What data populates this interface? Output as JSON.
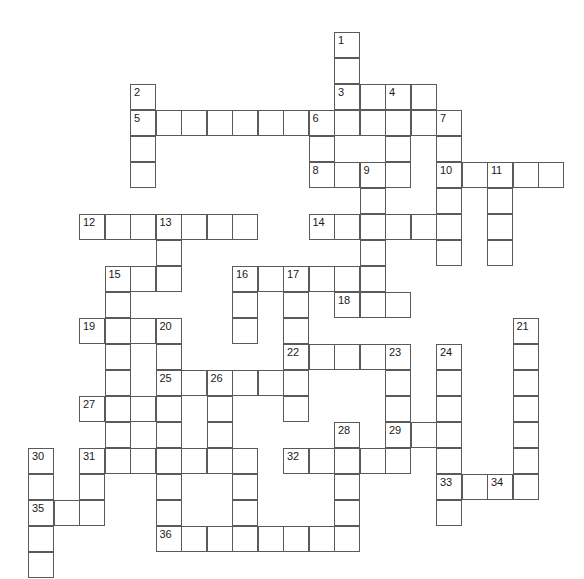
{
  "puzzle": {
    "title": "Crossword Grid",
    "type": "crossword-grid",
    "canvas": {
      "width": 584,
      "height": 579,
      "background": "#ffffff"
    },
    "geometry": {
      "cell_size": 26,
      "col_pitch": 25.5,
      "row_pitch": 26,
      "origin_x": 28,
      "origin_y": 32,
      "cell_border_color": "#5a5a5a",
      "cell_fill": "#ffffff",
      "number_color": "#1a1a1a",
      "number_font_size": 11
    },
    "counts": {
      "numbered_clues": 36,
      "total_cells": 197
    },
    "numbers": [
      1,
      2,
      3,
      4,
      5,
      6,
      7,
      8,
      9,
      10,
      11,
      12,
      13,
      14,
      15,
      16,
      17,
      18,
      19,
      20,
      21,
      22,
      23,
      24,
      25,
      26,
      27,
      28,
      29,
      30,
      31,
      32,
      33,
      34,
      35,
      36
    ],
    "cells": [
      {
        "r": 0,
        "c": 12,
        "n": "1"
      },
      {
        "r": 1,
        "c": 12
      },
      {
        "r": 2,
        "c": 12,
        "n": "3"
      },
      {
        "r": 2,
        "c": 13
      },
      {
        "r": 2,
        "c": 14,
        "n": "4"
      },
      {
        "r": 2,
        "c": 15
      },
      {
        "r": 2,
        "c": 4,
        "n": "2"
      },
      {
        "r": 3,
        "c": 4,
        "n": "5"
      },
      {
        "r": 3,
        "c": 5
      },
      {
        "r": 3,
        "c": 6
      },
      {
        "r": 3,
        "c": 7
      },
      {
        "r": 3,
        "c": 8
      },
      {
        "r": 3,
        "c": 9
      },
      {
        "r": 3,
        "c": 10
      },
      {
        "r": 3,
        "c": 11,
        "n": "6"
      },
      {
        "r": 3,
        "c": 12
      },
      {
        "r": 3,
        "c": 13
      },
      {
        "r": 3,
        "c": 14
      },
      {
        "r": 3,
        "c": 15
      },
      {
        "r": 3,
        "c": 16,
        "n": "7"
      },
      {
        "r": 4,
        "c": 4
      },
      {
        "r": 4,
        "c": 11
      },
      {
        "r": 4,
        "c": 14
      },
      {
        "r": 4,
        "c": 16
      },
      {
        "r": 5,
        "c": 4
      },
      {
        "r": 5,
        "c": 11,
        "n": "8"
      },
      {
        "r": 5,
        "c": 12
      },
      {
        "r": 5,
        "c": 13,
        "n": "9"
      },
      {
        "r": 5,
        "c": 14
      },
      {
        "r": 5,
        "c": 16,
        "n": "10"
      },
      {
        "r": 5,
        "c": 17
      },
      {
        "r": 5,
        "c": 18,
        "n": "11"
      },
      {
        "r": 5,
        "c": 19
      },
      {
        "r": 5,
        "c": 20
      },
      {
        "r": 6,
        "c": 13
      },
      {
        "r": 6,
        "c": 16
      },
      {
        "r": 6,
        "c": 18
      },
      {
        "r": 7,
        "c": 2,
        "n": "12"
      },
      {
        "r": 7,
        "c": 3
      },
      {
        "r": 7,
        "c": 4
      },
      {
        "r": 7,
        "c": 5,
        "n": "13"
      },
      {
        "r": 7,
        "c": 6
      },
      {
        "r": 7,
        "c": 7
      },
      {
        "r": 7,
        "c": 8
      },
      {
        "r": 7,
        "c": 11,
        "n": "14"
      },
      {
        "r": 7,
        "c": 12
      },
      {
        "r": 7,
        "c": 13
      },
      {
        "r": 7,
        "c": 14
      },
      {
        "r": 7,
        "c": 15
      },
      {
        "r": 7,
        "c": 16
      },
      {
        "r": 7,
        "c": 18
      },
      {
        "r": 8,
        "c": 5
      },
      {
        "r": 8,
        "c": 13
      },
      {
        "r": 8,
        "c": 16
      },
      {
        "r": 8,
        "c": 18
      },
      {
        "r": 9,
        "c": 3,
        "n": "15"
      },
      {
        "r": 9,
        "c": 4
      },
      {
        "r": 9,
        "c": 5
      },
      {
        "r": 9,
        "c": 8,
        "n": "16"
      },
      {
        "r": 9,
        "c": 9
      },
      {
        "r": 9,
        "c": 10,
        "n": "17"
      },
      {
        "r": 9,
        "c": 11
      },
      {
        "r": 9,
        "c": 12
      },
      {
        "r": 9,
        "c": 13
      },
      {
        "r": 10,
        "c": 3
      },
      {
        "r": 10,
        "c": 8
      },
      {
        "r": 10,
        "c": 10
      },
      {
        "r": 10,
        "c": 12,
        "n": "18"
      },
      {
        "r": 10,
        "c": 13
      },
      {
        "r": 10,
        "c": 14
      },
      {
        "r": 11,
        "c": 2,
        "n": "19"
      },
      {
        "r": 11,
        "c": 3
      },
      {
        "r": 11,
        "c": 4
      },
      {
        "r": 11,
        "c": 5,
        "n": "20"
      },
      {
        "r": 11,
        "c": 8
      },
      {
        "r": 11,
        "c": 10
      },
      {
        "r": 11,
        "c": 19,
        "n": "21"
      },
      {
        "r": 12,
        "c": 3
      },
      {
        "r": 12,
        "c": 5
      },
      {
        "r": 12,
        "c": 10,
        "n": "22"
      },
      {
        "r": 12,
        "c": 11
      },
      {
        "r": 12,
        "c": 12
      },
      {
        "r": 12,
        "c": 13
      },
      {
        "r": 12,
        "c": 14,
        "n": "23"
      },
      {
        "r": 12,
        "c": 16,
        "n": "24"
      },
      {
        "r": 12,
        "c": 19
      },
      {
        "r": 13,
        "c": 3
      },
      {
        "r": 13,
        "c": 5,
        "n": "25"
      },
      {
        "r": 13,
        "c": 6
      },
      {
        "r": 13,
        "c": 7,
        "n": "26"
      },
      {
        "r": 13,
        "c": 8
      },
      {
        "r": 13,
        "c": 9
      },
      {
        "r": 13,
        "c": 10
      },
      {
        "r": 13,
        "c": 14
      },
      {
        "r": 13,
        "c": 16
      },
      {
        "r": 13,
        "c": 19
      },
      {
        "r": 14,
        "c": 2,
        "n": "27"
      },
      {
        "r": 14,
        "c": 3
      },
      {
        "r": 14,
        "c": 4
      },
      {
        "r": 14,
        "c": 5
      },
      {
        "r": 14,
        "c": 7
      },
      {
        "r": 14,
        "c": 10
      },
      {
        "r": 14,
        "c": 14
      },
      {
        "r": 14,
        "c": 16
      },
      {
        "r": 14,
        "c": 19
      },
      {
        "r": 15,
        "c": 3
      },
      {
        "r": 15,
        "c": 5
      },
      {
        "r": 15,
        "c": 7
      },
      {
        "r": 15,
        "c": 12,
        "n": "28"
      },
      {
        "r": 15,
        "c": 14,
        "n": "29"
      },
      {
        "r": 15,
        "c": 15
      },
      {
        "r": 15,
        "c": 16
      },
      {
        "r": 15,
        "c": 19
      },
      {
        "r": 16,
        "c": 0,
        "n": "30"
      },
      {
        "r": 16,
        "c": 2,
        "n": "31"
      },
      {
        "r": 16,
        "c": 3
      },
      {
        "r": 16,
        "c": 4
      },
      {
        "r": 16,
        "c": 5
      },
      {
        "r": 16,
        "c": 6
      },
      {
        "r": 16,
        "c": 7
      },
      {
        "r": 16,
        "c": 8
      },
      {
        "r": 16,
        "c": 10,
        "n": "32"
      },
      {
        "r": 16,
        "c": 11
      },
      {
        "r": 16,
        "c": 12
      },
      {
        "r": 16,
        "c": 13
      },
      {
        "r": 16,
        "c": 14
      },
      {
        "r": 16,
        "c": 16
      },
      {
        "r": 16,
        "c": 19
      },
      {
        "r": 17,
        "c": 0
      },
      {
        "r": 17,
        "c": 2
      },
      {
        "r": 17,
        "c": 5
      },
      {
        "r": 17,
        "c": 8
      },
      {
        "r": 17,
        "c": 12
      },
      {
        "r": 17,
        "c": 16,
        "n": "33"
      },
      {
        "r": 17,
        "c": 17
      },
      {
        "r": 17,
        "c": 18,
        "n": "34"
      },
      {
        "r": 17,
        "c": 19
      },
      {
        "r": 18,
        "c": 0,
        "n": "35"
      },
      {
        "r": 18,
        "c": 1
      },
      {
        "r": 18,
        "c": 2
      },
      {
        "r": 18,
        "c": 5
      },
      {
        "r": 18,
        "c": 8
      },
      {
        "r": 18,
        "c": 12
      },
      {
        "r": 18,
        "c": 16
      },
      {
        "r": 19,
        "c": 0
      },
      {
        "r": 19,
        "c": 5,
        "n": "36"
      },
      {
        "r": 19,
        "c": 6
      },
      {
        "r": 19,
        "c": 7
      },
      {
        "r": 19,
        "c": 8
      },
      {
        "r": 19,
        "c": 9
      },
      {
        "r": 19,
        "c": 10
      },
      {
        "r": 19,
        "c": 11
      },
      {
        "r": 19,
        "c": 12
      },
      {
        "r": 20,
        "c": 0
      }
    ]
  }
}
